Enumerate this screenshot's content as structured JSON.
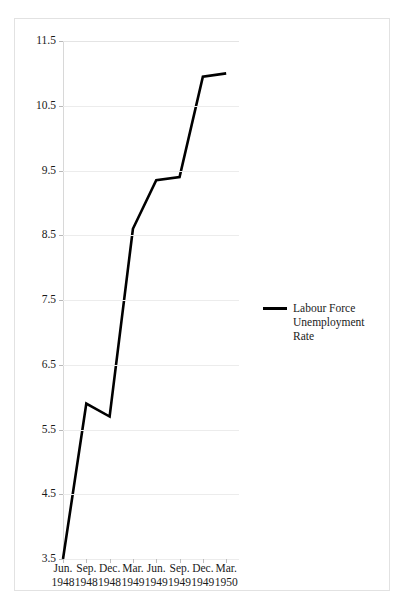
{
  "page": {
    "top_caption": "Figure — clipped heading"
  },
  "chart_data": {
    "type": "line",
    "title": "",
    "xlabel": "",
    "ylabel": "",
    "categories": [
      "Jun. 1948",
      "Sep. 1948",
      "Dec. 1948",
      "Mar. 1949",
      "Jun. 1949",
      "Sep. 1949",
      "Dec. 1949",
      "Mar. 1950"
    ],
    "x_tick_labels": [
      {
        "month": "Jun.",
        "year": "1948"
      },
      {
        "month": "Sep.",
        "year": "1948"
      },
      {
        "month": "Dec.",
        "year": "1948"
      },
      {
        "month": "Mar.",
        "year": "1949"
      },
      {
        "month": "Jun.",
        "year": "1949"
      },
      {
        "month": "Sep.",
        "year": "1949"
      },
      {
        "month": "Dec.",
        "year": "1949"
      },
      {
        "month": "Mar.",
        "year": "1950"
      }
    ],
    "series": [
      {
        "name": "Labour Force Unemployment Rate",
        "color": "#000000",
        "values": [
          3.5,
          5.9,
          5.7,
          8.6,
          9.35,
          9.4,
          10.95,
          11.0
        ]
      }
    ],
    "ylim": [
      3.5,
      11.5
    ],
    "y_tick_labels": [
      "11.5",
      "10.5",
      "9.5",
      "8.5",
      "7.5",
      "6.5",
      "5.5",
      "4.5",
      "3.5"
    ],
    "y_tick_values": [
      11.5,
      10.5,
      9.5,
      8.5,
      7.5,
      6.5,
      5.5,
      4.5,
      3.5
    ],
    "grid": true,
    "legend": {
      "position": "right",
      "entries": [
        {
          "label_line1": "Labour Force",
          "label_line2": "Unemployment Rate",
          "color": "#000000"
        }
      ]
    }
  }
}
